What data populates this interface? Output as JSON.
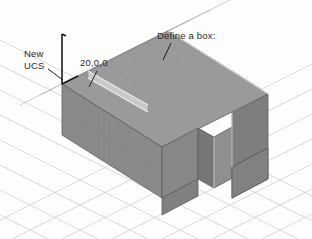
{
  "figure": {
    "kind": "cad-isometric-illustration",
    "background_color": "#fdfdfd",
    "grid": {
      "visible": true,
      "color": "#c9c9c9",
      "style": "isometric-diamond"
    },
    "object": {
      "name": "notched-box",
      "shape": "u-shaped-rectangular-solid",
      "top_face_color": "#9a9a9a",
      "front_face_color": "#8a8a8a",
      "right_face_color": "#7e7e7e",
      "notch_face_color": "#8f8f8f",
      "edge_color": "#5d5d5d",
      "highlight_edge_color": "#e8e8e8"
    },
    "ucs_indicator": {
      "visible": true,
      "color": "#1c1c1c",
      "axes": [
        "z-axis",
        "x-axis"
      ]
    }
  },
  "annotations": {
    "new_ucs": {
      "line1": "New",
      "line2": "UCS",
      "leader_color": "#1c1c1c"
    },
    "coordinate": {
      "text": "20,0,0",
      "leader_color": "#1c1c1c"
    },
    "define_box": {
      "text": "Define a box:",
      "leader_color": "#1c1c1c"
    }
  }
}
